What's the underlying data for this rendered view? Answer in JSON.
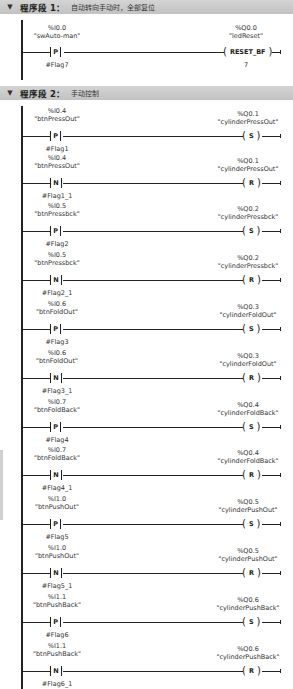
{
  "networks": [
    {
      "title": "程序段 1：",
      "comment": "自动转向手动时，全部复位",
      "rungs": [
        {
          "contact": {
            "address": "%I0.0",
            "tag": "\"swAuto-man\"",
            "type": "P",
            "flag": "#Flag7"
          },
          "coil": {
            "address": "%Q0.0",
            "tag": "\"ledReset\"",
            "type": "RESET_BF",
            "param": "7"
          }
        }
      ]
    },
    {
      "title": "程序段 2：",
      "comment": "手动控制",
      "rungs": [
        {
          "contact": {
            "address": "%I0.4",
            "tag": "\"btnPressOut\"",
            "type": "P",
            "flag": "#Flag1"
          },
          "coil": {
            "address": "%Q0.1",
            "tag": "\"cylinderPressOut\"",
            "type": "S"
          }
        },
        {
          "contact": {
            "address": "%I0.4",
            "tag": "\"btnPressOut\"",
            "type": "N",
            "flag": "#Flag1_1"
          },
          "coil": {
            "address": "%Q0.1",
            "tag": "\"cylinderPressOut\"",
            "type": "R"
          }
        },
        {
          "contact": {
            "address": "%I0.5",
            "tag": "\"btnPressbck\"",
            "type": "P",
            "flag": "#Flag2"
          },
          "coil": {
            "address": "%Q0.2",
            "tag": "\"cylinderPressbck\"",
            "type": "S"
          }
        },
        {
          "contact": {
            "address": "%I0.5",
            "tag": "\"btnPressbck\"",
            "type": "N",
            "flag": "#Flag2_1"
          },
          "coil": {
            "address": "%Q0.2",
            "tag": "\"cylinderPressbck\"",
            "type": "R"
          }
        },
        {
          "contact": {
            "address": "%I0.6",
            "tag": "\"btnFoldOut\"",
            "type": "P",
            "flag": "#Flag3"
          },
          "coil": {
            "address": "%Q0.3",
            "tag": "\"cylinderFoldOut\"",
            "type": "S"
          }
        },
        {
          "contact": {
            "address": "%I0.6",
            "tag": "\"btnFoldOut\"",
            "type": "N",
            "flag": "#Flag3_1"
          },
          "coil": {
            "address": "%Q0.3",
            "tag": "\"cylinderFoldOut\"",
            "type": "R"
          }
        },
        {
          "contact": {
            "address": "%I0.7",
            "tag": "\"btnFoldBack\"",
            "type": "P",
            "flag": "#Flag4"
          },
          "coil": {
            "address": "%Q0.4",
            "tag": "\"cylinderFoldBack\"",
            "type": "S"
          }
        },
        {
          "contact": {
            "address": "%I0.7",
            "tag": "\"btnFoldBack\"",
            "type": "N",
            "flag": "#Flag4_1"
          },
          "coil": {
            "address": "%Q0.4",
            "tag": "\"cylinderFoldBack\"",
            "type": "R"
          }
        },
        {
          "contact": {
            "address": "%I1.0",
            "tag": "\"btnPushOut\"",
            "type": "P",
            "flag": "#Flag5"
          },
          "coil": {
            "address": "%Q0.5",
            "tag": "\"cylinderPushOut\"",
            "type": "S"
          }
        },
        {
          "contact": {
            "address": "%I1.0",
            "tag": "\"btnPushOut\"",
            "type": "N",
            "flag": "#Flag5_1"
          },
          "coil": {
            "address": "%Q0.5",
            "tag": "\"cylinderPushOut\"",
            "type": "R"
          }
        },
        {
          "contact": {
            "address": "%I1.1",
            "tag": "\"btnPushBack\"",
            "type": "P",
            "flag": "#Flag6"
          },
          "coil": {
            "address": "%Q0.6",
            "tag": "\"cylinderPushBack\"",
            "type": "S"
          }
        },
        {
          "contact": {
            "address": "%I1.1",
            "tag": "\"btnPushBack\"",
            "type": "N",
            "flag": "#Flag6_1"
          },
          "coil": {
            "address": "%Q0.6",
            "tag": "\"cylinderPushBack\"",
            "type": "R"
          }
        }
      ]
    }
  ]
}
